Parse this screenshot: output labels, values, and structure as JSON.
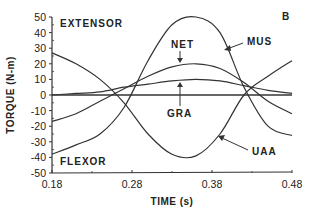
{
  "chart_data": {
    "type": "line",
    "title": "",
    "panel_label": "B",
    "xlabel": "TIME (s)",
    "ylabel": "TORQUE (N-m)",
    "xlim": [
      0.18,
      0.48
    ],
    "ylim": [
      -50,
      50
    ],
    "x_ticks": [
      "0.18",
      "0.28",
      "0.38",
      "0.48"
    ],
    "y_ticks": [
      "50",
      "40",
      "30",
      "20",
      "10",
      "0",
      "-10",
      "-20",
      "-30",
      "-40",
      "-50"
    ],
    "grid": false,
    "legend": "inline annotations",
    "annotations": [
      "EXTENSOR",
      "FLEXOR",
      "NET",
      "MUS",
      "GRA",
      "UAA",
      "B"
    ],
    "x": [
      0.18,
      0.21,
      0.24,
      0.27,
      0.3,
      0.33,
      0.36,
      0.39,
      0.42,
      0.45,
      0.48
    ],
    "series": [
      {
        "name": "MUS",
        "values": [
          -38,
          -32,
          -25,
          -8,
          22,
          45,
          50,
          40,
          5,
          -20,
          -26
        ]
      },
      {
        "name": "NET",
        "values": [
          -17,
          -12,
          -4,
          4,
          12,
          18,
          20,
          17,
          8,
          -4,
          -12
        ]
      },
      {
        "name": "GRA",
        "values": [
          0,
          1,
          2,
          5,
          7,
          9,
          10,
          9,
          6,
          3,
          1
        ]
      },
      {
        "name": "UAA",
        "values": [
          27,
          20,
          10,
          -5,
          -25,
          -38,
          -39,
          -25,
          0,
          12,
          22
        ]
      }
    ],
    "extensor_label": "EXTENSOR",
    "flexor_label": "FLEXOR"
  }
}
